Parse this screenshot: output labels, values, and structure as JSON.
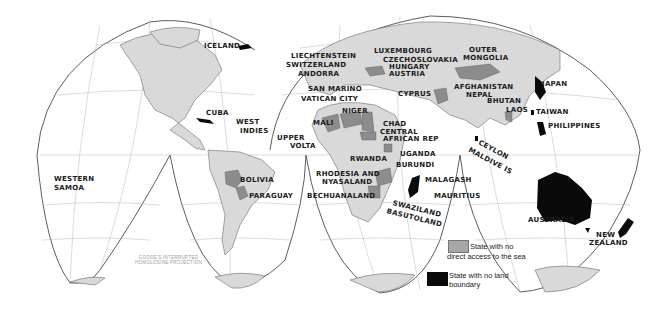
{
  "map": {
    "projection_note": [
      "GOODE'S INTERRUPTED",
      "HOMOLOSINE PROJECTION"
    ],
    "colors": {
      "background": "#ffffff",
      "land": "#d9d9d9",
      "landlocked": "#8c8c8c",
      "island_state": "#0a0a0a",
      "graticule": "#b5b5b5",
      "outline": "#333333"
    },
    "legend": [
      {
        "label_line1": "State with no",
        "label_line2": "direct access to the sea",
        "swatch": "#a6a6a6"
      },
      {
        "label_line1": "State with no land",
        "label_line2": "boundary",
        "swatch": "#0a0a0a"
      }
    ],
    "labels": {
      "iceland": "ICELAND",
      "cuba": "CUBA",
      "west_indies_1": "WEST",
      "west_indies_2": "INDIES",
      "western_samoa_1": "WESTERN",
      "western_samoa_2": "SAMOA",
      "bolivia": "BOLIVIA",
      "paraguay": "PARAGUAY",
      "liechtenstein": "LIECHTENSTEIN",
      "switzerland": "SWITZERLAND",
      "andorra": "ANDORRA",
      "san_marino": "SAN MARINO",
      "vatican_city": "VATICAN CITY",
      "luxembourg": "LUXEMBOURG",
      "czechoslovakia": "CZECHOSLOVAKIA",
      "hungary": "HUNGARY",
      "austria": "AUSTRIA",
      "cyprus": "CYPRUS",
      "outer_mongolia_1": "OUTER",
      "outer_mongolia_2": "MONGOLIA",
      "afghanistan": "AFGHANISTAN",
      "nepal": "NEPAL",
      "bhutan": "BHUTAN",
      "laos": "LAOS",
      "japan": "JAPAN",
      "taiwan": "TAIWAN",
      "philippines": "PHILIPPINES",
      "mali": "MALI",
      "niger": "NIGER",
      "chad": "CHAD",
      "central_african_rep_1": "CENTRAL",
      "central_african_rep_2": "AFRICAN REP",
      "upper_volta_1": "UPPER",
      "upper_volta_2": "VOLTA",
      "uganda": "UGANDA",
      "rwanda": "RWANDA",
      "burundi": "BURUNDI",
      "rhodesia_1": "RHODESIA AND",
      "rhodesia_2": "NYASALAND",
      "bechuanaland": "BECHUANALAND",
      "malagash": "MALAGASH",
      "mauritius": "MAURITIUS",
      "swaziland": "SWAZILAND",
      "basutoland": "BASUTOLAND",
      "ceylon": "CEYLON",
      "maldive": "MALDIVE IS",
      "australia": "AUSTRALIA",
      "new_zealand_1": "NEW",
      "new_zealand_2": "ZEALAND"
    }
  }
}
